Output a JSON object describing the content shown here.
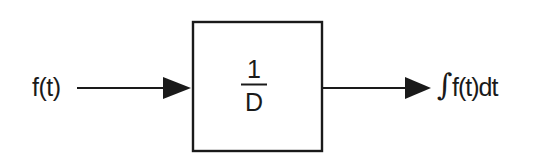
{
  "diagram": {
    "type": "block-diagram",
    "input": {
      "label": "f(t)"
    },
    "block": {
      "numerator": "1",
      "denominator": "D",
      "description": "integrator operator 1/D"
    },
    "output": {
      "integral_sign": "∫",
      "label": "f(t)dt"
    },
    "colors": {
      "stroke": "#1a1a1a",
      "background": "#ffffff"
    }
  }
}
